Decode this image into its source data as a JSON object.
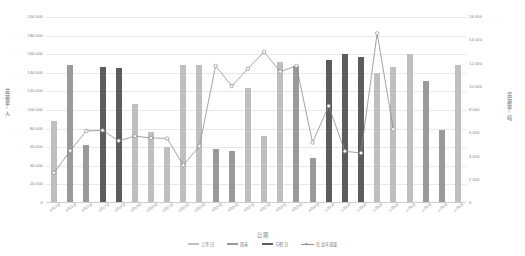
{
  "chart_data": {
    "type": "bar",
    "title": "",
    "xlabel": "日期",
    "ylabel": "总运量/人",
    "ylabel_secondary": "货运量/吨",
    "ylim": [
      0,
      200000
    ],
    "ylim_secondary": [
      0,
      16000
    ],
    "grid": true,
    "legend_position": "bottom",
    "yticks": [
      "200 000",
      "180 000",
      "160 000",
      "140 000",
      "120 000",
      "100 000",
      "80 000",
      "60 000",
      "40 000",
      "20 000",
      "0"
    ],
    "ytick_values": [
      200000,
      180000,
      160000,
      140000,
      120000,
      100000,
      80000,
      60000,
      40000,
      20000,
      0
    ],
    "yticks_secondary": [
      "16 000",
      "14 000",
      "12 000",
      "10 000",
      "8 000",
      "6 000",
      "4 000",
      "2 000",
      "0"
    ],
    "ytick_values_secondary": [
      16000,
      14000,
      12000,
      10000,
      8000,
      6000,
      4000,
      2000,
      0
    ],
    "categories": [
      "4月14日",
      "4月15日",
      "4月16日",
      "4月17日",
      "4月18日",
      "4月19日",
      "4月20日",
      "4月21日",
      "4月22日",
      "4月23日",
      "4月24日",
      "4月25日",
      "4月26日",
      "4月27日",
      "4月28日",
      "4月29日",
      "4月30日",
      "5月1日",
      "5月2日",
      "5月3日",
      "5月4日",
      "5月5日",
      "5月6日",
      "5月7日",
      "5月8日",
      "5月9日"
    ],
    "bar_series": {
      "name": "总运量",
      "values": [
        88000,
        148000,
        62000,
        146000,
        145000,
        107000,
        76000,
        60000,
        148000,
        148000,
        58000,
        56000,
        124000,
        72000,
        152000,
        147000,
        48000,
        154000,
        160000,
        157000,
        140000,
        146000,
        160000,
        131000,
        78000,
        148000,
        85000
      ],
      "categories_colors": [
        "weekday",
        "weekend",
        "weekend",
        "holiday",
        "holiday",
        "weekday",
        "weekday",
        "weekday",
        "weekday",
        "weekday",
        "weekend",
        "weekend",
        "weekday",
        "weekday",
        "weekday",
        "weekend",
        "weekend",
        "holiday",
        "holiday",
        "holiday",
        "weekday",
        "weekday",
        "weekday",
        "weekend",
        "weekend",
        "weekday"
      ]
    },
    "line_series": {
      "name": "社会车流量",
      "values": [
        2600,
        4500,
        6200,
        6250,
        5350,
        5750,
        5600,
        5550,
        3250,
        4900,
        11800,
        10050,
        11550,
        13000,
        11300,
        11800,
        5200,
        8350,
        4450,
        4300,
        14600,
        6350
      ]
    },
    "legend": [
      {
        "label": "工作日",
        "color": "#bfbfbf",
        "kind": "bar"
      },
      {
        "label": "周末",
        "color": "#9a9a9a",
        "kind": "bar"
      },
      {
        "label": "节假日",
        "color": "#5c5c5c",
        "kind": "bar"
      },
      {
        "label": "社会车流量",
        "color": "#8c8c8c",
        "kind": "line"
      }
    ]
  },
  "colors": {
    "weekday": "#bfbfbf",
    "weekend": "#9a9a9a",
    "holiday": "#5c5c5c",
    "line": "#8c8c8c",
    "grid": "#e4e8ef",
    "text": "#808080"
  }
}
